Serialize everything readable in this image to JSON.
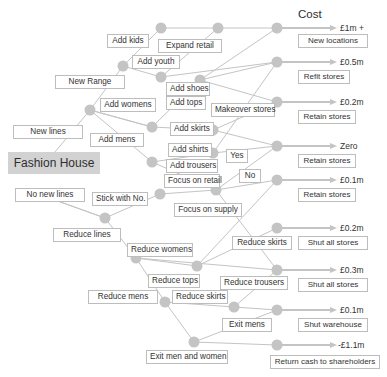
{
  "header": {
    "title": "Cost"
  },
  "root": {
    "label": "Fashion House"
  },
  "colors": {
    "line": "#c4c4c4",
    "node": "#c4c4c4",
    "root_fill": "#d2d2d2",
    "box_border": "#bdbdbd",
    "text": "#333333"
  },
  "decisions": {
    "new_lines": "New lines",
    "no_new_lines": "No new lines",
    "new_range": "New Range",
    "add_womens": "Add womens",
    "add_mens": "Add mens",
    "add_kids": "Add kids",
    "add_youth": "Add youth",
    "expand_retail": "Expand retail",
    "add_shoes": "Add shoes",
    "add_tops": "Add tops",
    "add_skirts": "Add skirts",
    "add_shirts": "Add shirts",
    "add_trousers": "Add trousers",
    "makeover_stores": "Makeover stores",
    "yes": "Yes",
    "no": "No",
    "stick_with_no": "Stick with No.",
    "focus_on_retail": "Focus on retail",
    "focus_on_supply": "Focus on supply",
    "reduce_lines": "Reduce lines",
    "reduce_womens": "Reduce womens",
    "reduce_mens": "Reduce mens",
    "reduce_tops": "Reduce tops",
    "reduce_skirts_upper": "Reduce skirts",
    "reduce_skirts_lower": "Reduce skirts",
    "reduce_trousers": "Reduce trousers",
    "exit_mens": "Exit mens",
    "exit_men_and_women": "Exit men and women"
  },
  "outcomes": [
    {
      "cost": "£1m +",
      "label": "New locations"
    },
    {
      "cost": "£0.5m",
      "label": "Refit stores"
    },
    {
      "cost": "£0.2m",
      "label": "Retain stores"
    },
    {
      "cost": "Zero",
      "label": "Retain stores"
    },
    {
      "cost": "£0.1m",
      "label": "Retain stores"
    },
    {
      "cost": "£0.2m",
      "label": "Shut all stores"
    },
    {
      "cost": "£0.3m",
      "label": "Shut all stores"
    },
    {
      "cost": "£0.1m",
      "label": "Shut warehouse"
    },
    {
      "cost": "-£1.1m",
      "label": "Return cash to shareholders"
    }
  ]
}
